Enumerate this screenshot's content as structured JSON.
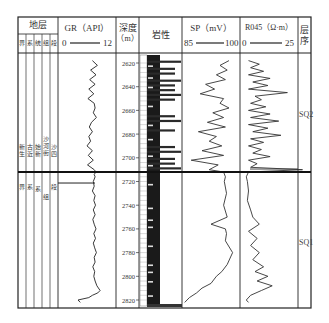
{
  "header": {
    "strata_title": "地层",
    "strata_cols": [
      "界",
      "系",
      "统",
      "组",
      "段"
    ],
    "gr": {
      "title": "GR（API）",
      "min": "0",
      "max": "12"
    },
    "depth": {
      "title_line1": "深度",
      "title_line2": "（m）"
    },
    "lithology": {
      "title": "岩性"
    },
    "sp": {
      "title": "SP（mV）",
      "min": "85",
      "max": "100"
    },
    "r045": {
      "title": "R045（Ω·m）",
      "min": "0",
      "max": "25"
    },
    "sequence": {
      "title_line1": "层",
      "title_line2": "序"
    }
  },
  "strata": {
    "upper": [
      "新生",
      "古近",
      "始新",
      "沙河街",
      "沙四"
    ],
    "lower": [
      "界",
      "系",
      "系",
      "组",
      "段"
    ]
  },
  "sequences": [
    {
      "label": "SQ2",
      "top_depth": 2612,
      "bottom_depth": 2712
    },
    {
      "label": "SQ1",
      "top_depth": 2712,
      "bottom_depth": 2825
    }
  ],
  "chart_data": {
    "type": "line",
    "y_axis": {
      "label": "深度（m）",
      "ticks": [
        2620,
        2640,
        2660,
        2680,
        2700,
        2720,
        2740,
        2760,
        2780,
        2800,
        2820
      ],
      "range": [
        2612,
        2825
      ],
      "inverted": true
    },
    "boundary_depth": 2712,
    "series": [
      {
        "name": "GR (API)",
        "xlim": [
          0,
          12
        ],
        "depth": [
          2618,
          2622,
          2626,
          2630,
          2634,
          2638,
          2642,
          2646,
          2650,
          2654,
          2658,
          2662,
          2666,
          2670,
          2674,
          2678,
          2682,
          2686,
          2690,
          2694,
          2698,
          2702,
          2706,
          2710,
          2712,
          2714,
          2716,
          2720,
          2724,
          2728,
          2732,
          2736,
          2740,
          2744,
          2748,
          2752,
          2756,
          2760,
          2764,
          2768,
          2772,
          2776,
          2780,
          2784,
          2788,
          2792,
          2796,
          2800,
          2804,
          2808,
          2812,
          2814,
          2816,
          2818,
          2820,
          2822
        ],
        "values": [
          7.2,
          8.3,
          6.8,
          8.0,
          6.6,
          7.8,
          6.4,
          7.5,
          6.2,
          7.6,
          7.8,
          7.4,
          8.1,
          7.0,
          6.5,
          7.2,
          6.4,
          6.8,
          6.0,
          7.2,
          6.3,
          7.4,
          6.1,
          7.6,
          8.0,
          7.6,
          7.8,
          7.4,
          7.6,
          7.2,
          7.8,
          7.5,
          7.9,
          7.4,
          7.8,
          7.3,
          7.6,
          8.0,
          7.5,
          7.9,
          7.4,
          7.7,
          8.1,
          7.6,
          7.8,
          7.3,
          7.7,
          7.5,
          7.8,
          8.2,
          8.9,
          8.4,
          7.2,
          6.4,
          4.0,
          4.5
        ]
      },
      {
        "name": "SP (mV)",
        "xlim": [
          85,
          100
        ],
        "depth": [
          2618,
          2622,
          2626,
          2630,
          2634,
          2638,
          2642,
          2646,
          2650,
          2654,
          2658,
          2662,
          2666,
          2670,
          2674,
          2678,
          2682,
          2686,
          2690,
          2694,
          2698,
          2702,
          2706,
          2710,
          2712,
          2716,
          2720,
          2730,
          2740,
          2750,
          2756,
          2760,
          2764,
          2770,
          2780,
          2790,
          2796,
          2800,
          2806,
          2810,
          2814,
          2818,
          2822
        ],
        "values": [
          97.5,
          95.0,
          97.0,
          94.0,
          96.5,
          91.0,
          93.5,
          89.5,
          96.0,
          95.0,
          97.5,
          93.0,
          96.0,
          91.5,
          96.5,
          89.0,
          94.0,
          92.0,
          95.5,
          90.0,
          96.0,
          87.0,
          94.5,
          92.0,
          96.0,
          96.5,
          96.2,
          96.8,
          96.0,
          97.0,
          92.5,
          96.5,
          96.8,
          96.5,
          98.5,
          97.0,
          95.5,
          94.0,
          92.5,
          90.0,
          88.5,
          86.5,
          85.2
        ]
      },
      {
        "name": "R045 (Ω·m)",
        "xlim": [
          0,
          25
        ],
        "depth": [
          2618,
          2621,
          2624,
          2627,
          2630,
          2633,
          2636,
          2639,
          2642,
          2645,
          2648,
          2651,
          2654,
          2657,
          2660,
          2663,
          2666,
          2669,
          2672,
          2675,
          2678,
          2681,
          2684,
          2687,
          2690,
          2693,
          2696,
          2699,
          2702,
          2705,
          2708,
          2710,
          2712,
          2716,
          2720,
          2728,
          2736,
          2744,
          2750,
          2756,
          2762,
          2768,
          2774,
          2780,
          2786,
          2792,
          2796,
          2800,
          2804,
          2808,
          2812,
          2816,
          2820,
          2822
        ],
        "values": [
          3,
          8,
          4,
          10,
          3,
          13,
          5,
          12,
          3,
          21,
          6,
          9,
          4,
          11,
          3,
          13,
          4,
          17,
          3,
          12,
          5,
          18,
          4,
          10,
          3,
          9,
          5,
          13,
          3,
          7,
          4,
          28,
          3,
          2,
          2.5,
          3,
          2.5,
          4,
          5,
          8,
          3,
          7,
          4,
          8,
          5,
          10,
          6,
          12,
          7,
          14,
          9,
          4,
          2,
          3
        ]
      }
    ],
    "lithology_note": "Interbedded sandstone (dotted/white) and dark mudstone (black) bands; thicker dark mudstone in SQ1"
  }
}
